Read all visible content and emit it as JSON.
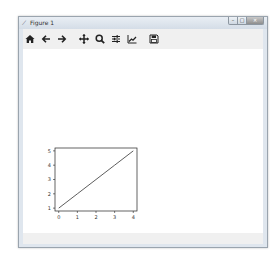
{
  "window": {
    "title": "Figure 1",
    "controls": {
      "minimize": "–",
      "maximize": "□",
      "close": "✕"
    }
  },
  "toolbar": {
    "buttons": [
      {
        "name": "home",
        "icon": "home-icon",
        "label": "Home"
      },
      {
        "name": "back",
        "icon": "arrow-left-icon",
        "label": "Back"
      },
      {
        "name": "forward",
        "icon": "arrow-right-icon",
        "label": "Forward"
      },
      {
        "name": "pan",
        "icon": "move-icon",
        "label": "Pan"
      },
      {
        "name": "zoom",
        "icon": "magnifier-icon",
        "label": "Zoom"
      },
      {
        "name": "subplots",
        "icon": "sliders-icon",
        "label": "Configure subplots"
      },
      {
        "name": "edit",
        "icon": "line-chart-icon",
        "label": "Edit axis"
      },
      {
        "name": "save",
        "icon": "floppy-disk-icon",
        "label": "Save"
      }
    ]
  },
  "chart_data": {
    "type": "line",
    "title": "",
    "xlabel": "",
    "ylabel": "",
    "x": [
      0,
      1,
      2,
      3,
      4
    ],
    "series": [
      {
        "name": "line",
        "values": [
          1,
          2,
          3,
          4,
          5
        ]
      }
    ],
    "xticks": [
      "0",
      "1",
      "2",
      "3",
      "4"
    ],
    "yticks": [
      "1",
      "2",
      "3",
      "4",
      "5"
    ],
    "xlim": [
      -0.2,
      4.2
    ],
    "ylim": [
      0.8,
      5.2
    ],
    "grid": false,
    "legend": null
  }
}
